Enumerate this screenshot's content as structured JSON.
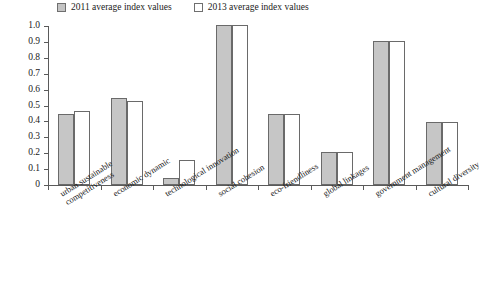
{
  "legend": {
    "entries": [
      {
        "label": "2011 average index values",
        "series_key": "2011",
        "swatch": "gray-filled-square"
      },
      {
        "label": "2013 average index values",
        "series_key": "2013",
        "swatch": "white-outlined-square"
      }
    ]
  },
  "axis": {
    "y_ticks": [
      "1.0",
      "0.9",
      "0.8",
      "0.7",
      "0.6",
      "0.5",
      "0.4",
      "0.3",
      "0.2",
      "0.1",
      "0"
    ]
  },
  "colors": {
    "series_2011_fill": "#c6c6c6",
    "series_2013_fill": "#ffffff",
    "bar_stroke": "#6a6a6a",
    "axis": "#5a5a5a",
    "text": "#1a1a1a",
    "background": "#ffffff"
  },
  "chart_data": {
    "type": "bar",
    "title": "",
    "subtitle": "",
    "xlabel": "",
    "ylabel": "",
    "ylim": [
      0,
      1.0
    ],
    "ytick_step": 0.1,
    "grid": false,
    "legend_position": "top-left",
    "orientation": "vertical",
    "grouping": "grouped",
    "categories": [
      "urban sustainable competitiveness",
      "economic dynamic",
      "technological innovation",
      "social cohesion",
      "eco-friendliness",
      "global linkages",
      "government management",
      "cultural diversity"
    ],
    "category_lines": [
      [
        "urban sustainable",
        "competitiveness"
      ],
      [
        "economic dynamic"
      ],
      [
        "technological innovation"
      ],
      [
        "social cohesion"
      ],
      [
        "eco-friendliness"
      ],
      [
        "global linkages"
      ],
      [
        "government management"
      ],
      [
        "cultural diversity"
      ]
    ],
    "series": [
      {
        "name": "2011 average index values",
        "values": [
          0.44,
          0.54,
          0.04,
          1.0,
          0.44,
          0.2,
          0.9,
          0.39
        ]
      },
      {
        "name": "2013 average index values",
        "values": [
          0.46,
          0.52,
          0.15,
          1.0,
          0.44,
          0.2,
          0.9,
          0.39
        ]
      }
    ]
  }
}
